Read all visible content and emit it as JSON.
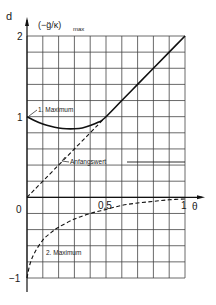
{
  "chart_data": {
    "type": "line",
    "panel_label": "d",
    "title": "",
    "ylabel": "(-g̈/κ)max",
    "ylabel_main": "(−g̈/κ)",
    "ylabel_sub": "max",
    "xlabel": "θ",
    "xlim": [
      0,
      1
    ],
    "ylim": [
      -1,
      2
    ],
    "x_ticks": [
      {
        "value": 0,
        "label": "0"
      },
      {
        "value": 0.5,
        "label": "0,5"
      },
      {
        "value": 1,
        "label": "1"
      }
    ],
    "y_ticks": [
      {
        "value": 2,
        "label": "2"
      },
      {
        "value": 1,
        "label": "1"
      },
      {
        "value": -1,
        "label": "−1"
      }
    ],
    "grid": true,
    "grid_x_step": 0.1,
    "grid_y_step": 0.2,
    "series": [
      {
        "name": "1. Maximum",
        "style": "solid",
        "x": [
          0,
          0.05,
          0.1,
          0.15,
          0.2,
          0.25,
          0.3,
          0.35,
          0.4,
          0.45,
          0.49,
          0.6,
          0.7,
          0.8,
          0.9,
          1.0
        ],
        "y": [
          1.0,
          0.95,
          0.91,
          0.88,
          0.86,
          0.85,
          0.85,
          0.86,
          0.89,
          0.93,
          0.98,
          1.2,
          1.4,
          1.6,
          1.8,
          2.0
        ]
      },
      {
        "name": "Anfangswert",
        "style": "dashed",
        "x": [
          0,
          0.49
        ],
        "y": [
          0,
          0.98
        ]
      },
      {
        "name": "2. Maximum",
        "style": "dashed",
        "x": [
          0,
          0.02,
          0.05,
          0.1,
          0.15,
          0.2,
          0.3,
          0.4,
          0.5,
          0.6,
          0.7,
          0.8,
          0.9,
          1.0
        ],
        "y": [
          -1.0,
          -0.82,
          -0.68,
          -0.53,
          -0.44,
          -0.37,
          -0.27,
          -0.2,
          -0.15,
          -0.1,
          -0.07,
          -0.05,
          -0.03,
          -0.02
        ]
      }
    ],
    "annotations": [
      {
        "text": "1. Maximum",
        "x": 0.06,
        "y": 1.05
      },
      {
        "text": "Anfangswert",
        "x": 0.25,
        "y": 0.45
      },
      {
        "text": "2. Maximum",
        "x": 0.12,
        "y": -0.6
      }
    ]
  },
  "labels": {
    "panel": "d",
    "ylabel_main": "(−g̈/κ)",
    "ylabel_sub": "max",
    "x_tick_0": "0",
    "x_tick_05": "0,5",
    "x_tick_1": "1",
    "x_axis_symbol": "θ",
    "y_tick_2": "2",
    "y_tick_1": "1",
    "y_tick_m1": "−1",
    "ann_max1": "1. Maximum",
    "ann_anfang": "Anfangswert",
    "ann_max2": "2. Maximum"
  }
}
